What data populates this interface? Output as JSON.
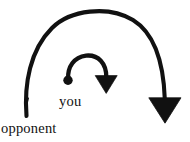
{
  "diagram": {
    "background_color": "#ffffff",
    "ink_color": "#111111",
    "width": 190,
    "height": 142,
    "labels": {
      "inner": "you",
      "outer": "opponent"
    },
    "arrows": {
      "outer": {
        "name": "opponent-rotation-arrow",
        "direction": "clockwise",
        "stroke_width": 4,
        "color": "#111111",
        "start_point": [
          26,
          116
        ],
        "apex_point": [
          95,
          12
        ],
        "end_point": [
          165,
          100
        ],
        "arrowhead": {
          "shape": "triangle",
          "points_toward": "down",
          "tip": [
            165,
            123
          ],
          "left": [
            149,
            98
          ],
          "right": [
            181,
            98
          ]
        },
        "start_cap": "plain-taper"
      },
      "inner": {
        "name": "you-rotation-arrow",
        "direction": "clockwise",
        "stroke_width": 4.2,
        "color": "#111111",
        "start_point": [
          68,
          79
        ],
        "apex_point": [
          89,
          56
        ],
        "end_point": [
          106,
          79
        ],
        "arrowhead": {
          "shape": "triangle",
          "points_toward": "down",
          "tip": [
            106,
            93
          ],
          "left": [
            95,
            76
          ],
          "right": [
            117,
            76
          ]
        },
        "start_cap": "filled-dot",
        "start_dot_radius": 5
      }
    }
  }
}
